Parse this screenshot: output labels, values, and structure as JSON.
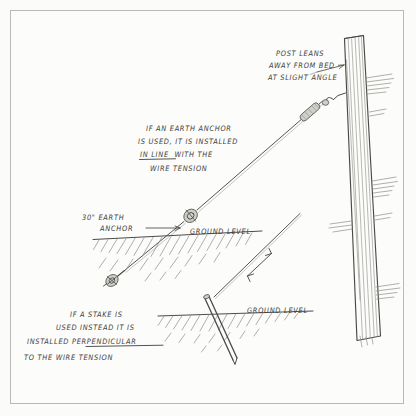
{
  "document": {
    "title": "Guy wire anchor installation sketch",
    "paper_color": "#fcfcfa",
    "ink_color": "#4a4a48",
    "frame_color": "#b9b9b5"
  },
  "annotations": {
    "post_note": {
      "name": "post-leans-note",
      "lines": [
        "POST LEANS",
        "AWAY FROM BED",
        "AT SLIGHT ANGLE"
      ]
    },
    "earth_anchor_note": {
      "name": "earth-anchor-note",
      "lines": [
        "IF AN EARTH ANCHOR",
        "IS USED, IT IS INSTALLED",
        "IN LINE  WITH THE",
        "WIRE TENSION"
      ],
      "emphasis": "IN LINE",
      "emphasis_style": "underline"
    },
    "stake_note": {
      "name": "stake-note",
      "lines": [
        "IF A STAKE IS",
        "USED INSTEAD IT IS",
        "INSTALLED PERPENDICULAR",
        "TO THE WIRE TENSION"
      ],
      "emphasis": "PERPENDICULAR",
      "emphasis_style": "underline"
    },
    "anchor_label": {
      "name": "earth-anchor-label",
      "lines": [
        "30\" EARTH",
        "ANCHOR"
      ],
      "size": "30\"",
      "unit": "inches"
    },
    "ground_label_upper": "GROUND LEVEL",
    "ground_label_lower": "GROUND LEVEL"
  },
  "elements": {
    "post": "leaning-wooden-post",
    "guy_wire_upper": "guy-wire-to-earth-anchor",
    "guy_wire_lower": "guy-wire-to-stake",
    "turnbuckle_post": "turnbuckle-at-post",
    "turnbuckle_anchor": "turnbuckle-at-anchor",
    "earth_anchor": "earth-anchor-rod",
    "stake": "driven-stake",
    "tension_arrow": "wire-tension-double-arrow",
    "ground_upper": "ground-line-upper",
    "ground_lower": "ground-line-lower"
  }
}
